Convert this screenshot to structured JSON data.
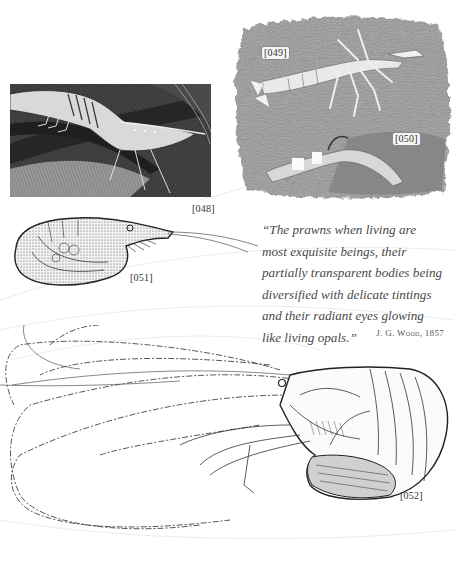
{
  "figures": [
    {
      "id": "fig-048",
      "label": "[048]",
      "description": "shrimp on dark seaweed engraving",
      "style": "dark-tone"
    },
    {
      "id": "fig-049",
      "label": "[049]",
      "description": "pale shrimp swimming over grey water texture",
      "style": "grey-tone"
    },
    {
      "id": "fig-050",
      "label": "[050]",
      "description": "shrimp among rocks, grey water texture",
      "style": "grey-tone"
    },
    {
      "id": "fig-051",
      "label": "[051]",
      "description": "small curled prawn line engraving",
      "style": "line"
    },
    {
      "id": "fig-052",
      "label": "[052]",
      "description": "large prawn with long antennae line engraving",
      "style": "line"
    }
  ],
  "quote": {
    "lines": [
      "“The prawns when living are",
      "most exquisite beings, their",
      "partially transparent bodies being",
      "diversified with delicate tintings",
      "and their radiant eyes glowing",
      "like living opals.”"
    ],
    "attribution": "J. G. Wood, 1857"
  },
  "colors": {
    "page": "#ffffff",
    "text": "#4a4a4a",
    "engraving_dark": "#2b2b2b",
    "engraving_grey": "#9a9a9a"
  }
}
